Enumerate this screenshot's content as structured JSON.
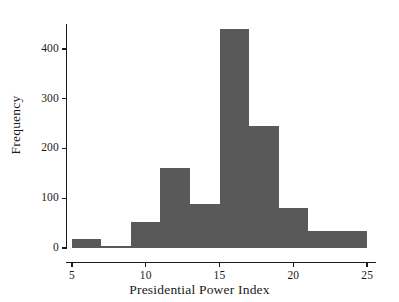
{
  "chart_data": {
    "type": "bar",
    "title": "",
    "subtitle": "",
    "xlabel": "Presidential Power Index",
    "ylabel": "Frequency",
    "xlim": [
      4.6,
      25.6
    ],
    "ylim": [
      0,
      450
    ],
    "grid": false,
    "legend": null,
    "bin_width": 2,
    "bin_edges": [
      5,
      7,
      9,
      11,
      13,
      15,
      17,
      19,
      21,
      23,
      25
    ],
    "categories": [
      "5-7",
      "7-9",
      "9-11",
      "11-13",
      "13-15",
      "15-17",
      "17-19",
      "19-21",
      "21-23",
      "23-25"
    ],
    "values": [
      18,
      5,
      52,
      160,
      88,
      440,
      245,
      80,
      35,
      35
    ],
    "bars": [
      {
        "label": "5-7",
        "x0": 5,
        "x1": 7,
        "value": 18
      },
      {
        "label": "7-9",
        "x0": 7,
        "x1": 9,
        "value": 5
      },
      {
        "label": "9-11",
        "x0": 9,
        "x1": 11,
        "value": 52
      },
      {
        "label": "11-13",
        "x0": 11,
        "x1": 13,
        "value": 160
      },
      {
        "label": "13-15",
        "x0": 13,
        "x1": 15,
        "value": 88
      },
      {
        "label": "15-17",
        "x0": 15,
        "x1": 17,
        "value": 440
      },
      {
        "label": "17-19",
        "x0": 17,
        "x1": 19,
        "value": 245
      },
      {
        "label": "19-21",
        "x0": 19,
        "x1": 21,
        "value": 80
      },
      {
        "label": "21-23",
        "x0": 21,
        "x1": 23,
        "value": 35
      },
      {
        "label": "23-25",
        "x0": 23,
        "x1": 25,
        "value": 35
      }
    ],
    "xticks": [
      5,
      10,
      15,
      20,
      25
    ],
    "xtick_labels": [
      "5",
      "10",
      "15",
      "20",
      "25"
    ],
    "yticks": [
      0,
      100,
      200,
      300,
      400
    ],
    "ytick_labels": [
      "0",
      "100",
      "200",
      "300",
      "400"
    ],
    "colors": {
      "bar": "#595959",
      "axis": "#1a1a1a",
      "text": "#1a1a1a",
      "background": "#ffffff"
    }
  }
}
